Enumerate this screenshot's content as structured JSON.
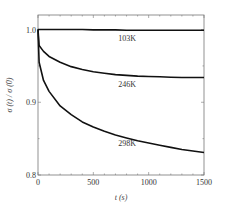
{
  "chart_data": {
    "type": "line",
    "title": "",
    "xlabel": "t (s)",
    "ylabel": "σ (t) / σ (0)",
    "xlim": [
      0,
      1500
    ],
    "ylim": [
      0.8,
      1.02
    ],
    "x_ticks": [
      0,
      500,
      1000,
      1500
    ],
    "x_tick_labels": [
      "0",
      "500",
      "1000",
      "1500"
    ],
    "y_ticks": [
      0.8,
      0.9,
      1.0
    ],
    "y_tick_labels": [
      "0.8",
      "0.9",
      "1.0"
    ],
    "grid": false,
    "legend": "inline labels",
    "x": [
      0,
      10,
      50,
      100,
      200,
      300,
      400,
      500,
      600,
      700,
      800,
      900,
      1000,
      1100,
      1200,
      1300,
      1400,
      1500
    ],
    "series": [
      {
        "name": "103K",
        "values": [
          1.0,
          1.0,
          1.0,
          1.0,
          1.0,
          1.0,
          1.0,
          0.9995,
          0.9995,
          0.9995,
          0.999,
          0.999,
          0.999,
          0.999,
          0.999,
          0.999,
          0.999,
          0.999
        ],
        "label_pos": [
          805,
          0.989
        ]
      },
      {
        "name": "246K",
        "values": [
          1.0,
          0.978,
          0.97,
          0.963,
          0.955,
          0.949,
          0.945,
          0.942,
          0.94,
          0.938,
          0.937,
          0.936,
          0.9355,
          0.935,
          0.9345,
          0.934,
          0.934,
          0.934
        ],
        "label_pos": [
          805,
          0.925
        ]
      },
      {
        "name": "298K",
        "values": [
          1.0,
          0.955,
          0.93,
          0.915,
          0.895,
          0.883,
          0.873,
          0.866,
          0.86,
          0.855,
          0.851,
          0.847,
          0.844,
          0.841,
          0.838,
          0.835,
          0.833,
          0.831
        ],
        "label_pos": [
          805,
          0.844
        ]
      }
    ]
  }
}
